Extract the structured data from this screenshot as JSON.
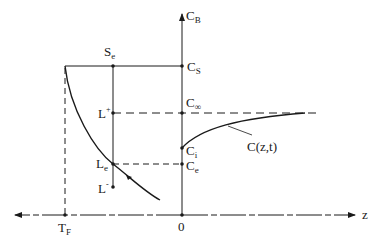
{
  "diagram": {
    "type": "phase-diagram-concentration-profile",
    "axes": {
      "vertical_label": "C",
      "vertical_label_sub": "B",
      "horizontal_label": "z",
      "origin_label": "0"
    },
    "vertical_axis_labels": {
      "cs": {
        "main": "C",
        "sub": "S"
      },
      "cinf": {
        "main": "C",
        "sub": "∞"
      },
      "ci": {
        "main": "C",
        "sub": "i"
      },
      "ce": {
        "main": "C",
        "sub": "e"
      }
    },
    "left_labels": {
      "se": {
        "main": "S",
        "sub": "e"
      },
      "lplus": {
        "main": "L",
        "sup": "+"
      },
      "le": {
        "main": "L",
        "sub": "e"
      },
      "lminus": {
        "main": "L",
        "sup": "-"
      },
      "tf": {
        "main": "T",
        "sub": "F"
      }
    },
    "curve_label": "C(z,t)",
    "colors": {
      "line": "#1a1a1a",
      "background": "#ffffff"
    }
  }
}
